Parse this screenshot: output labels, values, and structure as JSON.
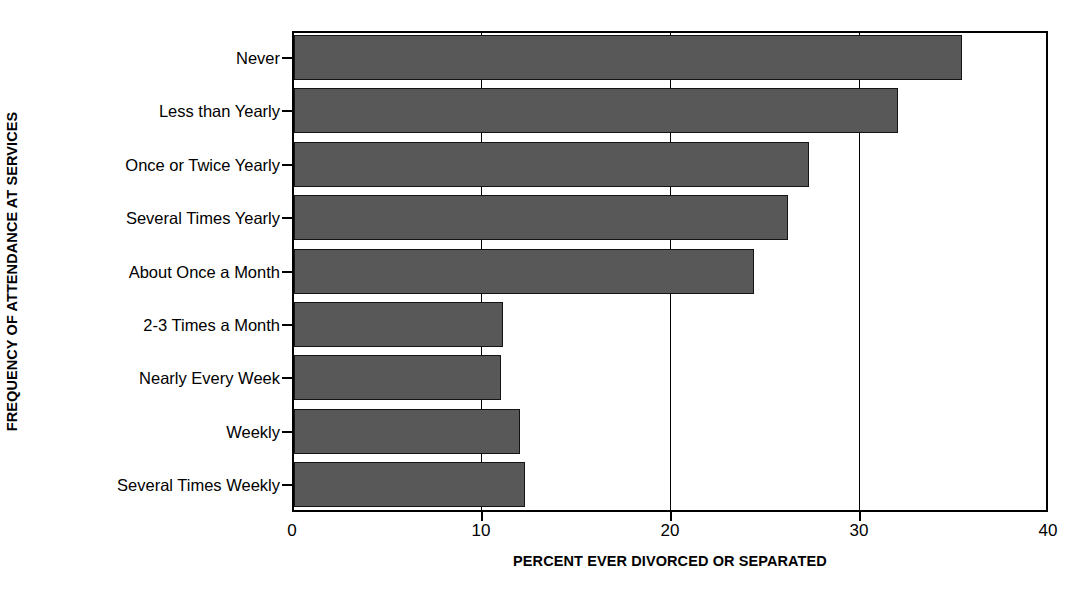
{
  "chart_data": {
    "type": "bar",
    "orientation": "horizontal",
    "title": "",
    "xlabel": "PERCENT EVER DIVORCED OR SEPARATED",
    "ylabel": "FREQUENCY OF ATTENDANCE AT SERVICES",
    "categories": [
      "Never",
      "Less than Yearly",
      "Once or Twice Yearly",
      "Several Times Yearly",
      "About Once a Month",
      "2-3 Times a Month",
      "Nearly Every Week",
      "Weekly",
      "Several Times Weekly"
    ],
    "values": [
      35.2,
      31.8,
      27.1,
      26.0,
      24.2,
      10.9,
      10.8,
      11.8,
      12.1
    ],
    "xlim": [
      0,
      40
    ],
    "xticks": [
      0,
      10,
      20,
      30,
      40
    ],
    "xticklabels": [
      "0",
      "10",
      "20",
      "30",
      "40"
    ],
    "grid": "vertical",
    "legend": "none",
    "bar_color": "#585858",
    "bar_edge_color": "#141414",
    "axis_color": "#000000",
    "background": "#ffffff"
  }
}
